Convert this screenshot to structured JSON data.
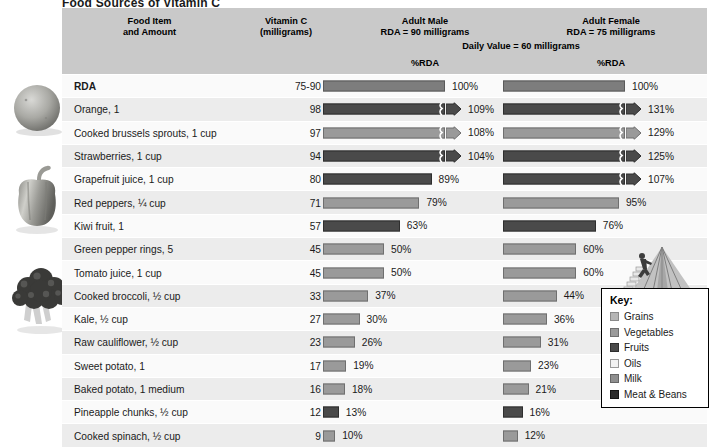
{
  "title": "Food Sources of Vitamin C",
  "header": {
    "food_item": "Food Item",
    "food_item_line2": "and Amount",
    "vitamin_c": "Vitamin C",
    "vitamin_c_line2": "(milligrams)",
    "adult_male": "Adult Male",
    "adult_male_line2": "RDA = 90 milligrams",
    "adult_female": "Adult Female",
    "adult_female_line2": "RDA = 75 milligrams",
    "daily_value": "Daily Value = 60 milligrams",
    "pct_rda_male": "%RDA",
    "pct_rda_female": "%RDA"
  },
  "chart_data": {
    "type": "bar",
    "title": "Food Sources of Vitamin C",
    "xlabel": "%RDA",
    "ylabel": "Food Item and Amount",
    "xlim": [
      0,
      100
    ],
    "grid": false,
    "legend_position": "bottom-right",
    "categories": [
      "RDA",
      "Orange, 1",
      "Cooked brussels sprouts, 1 cup",
      "Strawberries, 1 cup",
      "Grapefruit juice, 1 cup",
      "Red peppers, ¼ cup",
      "Kiwi fruit, 1",
      "Green pepper rings, 5",
      "Tomato juice, 1 cup",
      "Cooked broccoli, ½ cup",
      "Kale, ½ cup",
      "Raw cauliflower, ½ cup",
      "Sweet potato, 1",
      "Baked potato, 1 medium",
      "Pineapple chunks, ½ cup",
      "Cooked spinach, ½ cup"
    ],
    "series": [
      {
        "name": "Vitamin C (milligrams)",
        "values": [
          null,
          98,
          97,
          94,
          80,
          71,
          57,
          45,
          45,
          33,
          27,
          23,
          17,
          16,
          12,
          9
        ]
      },
      {
        "name": "Adult Male %RDA",
        "values": [
          100,
          109,
          108,
          104,
          89,
          79,
          63,
          50,
          50,
          37,
          30,
          26,
          19,
          18,
          13,
          10
        ]
      },
      {
        "name": "Adult Female %RDA",
        "values": [
          100,
          131,
          129,
          125,
          107,
          95,
          76,
          60,
          60,
          44,
          36,
          31,
          23,
          21,
          16,
          12
        ]
      }
    ]
  },
  "rows": [
    {
      "name": "RDA",
      "amount": "75-90",
      "male_pct": 100,
      "male_label": "100%",
      "female_pct": 100,
      "female_label": "100%",
      "group": "rda",
      "bold": true
    },
    {
      "name": "Orange, 1",
      "amount": "98",
      "male_pct": 109,
      "male_label": "109%",
      "female_pct": 131,
      "female_label": "131%",
      "group": "fruits",
      "bold": false
    },
    {
      "name": "Cooked brussels sprouts, 1 cup",
      "amount": "97",
      "male_pct": 108,
      "male_label": "108%",
      "female_pct": 129,
      "female_label": "129%",
      "group": "veg",
      "bold": false
    },
    {
      "name": "Strawberries, 1 cup",
      "amount": "94",
      "male_pct": 104,
      "male_label": "104%",
      "female_pct": 125,
      "female_label": "125%",
      "group": "fruits",
      "bold": false
    },
    {
      "name": "Grapefruit juice, 1 cup",
      "amount": "80",
      "male_pct": 89,
      "male_label": "89%",
      "female_pct": 107,
      "female_label": "107%",
      "group": "fruits",
      "bold": false
    },
    {
      "name": "Red peppers, ¼ cup",
      "amount": "71",
      "male_pct": 79,
      "male_label": "79%",
      "female_pct": 95,
      "female_label": "95%",
      "group": "veg",
      "bold": false
    },
    {
      "name": "Kiwi fruit, 1",
      "amount": "57",
      "male_pct": 63,
      "male_label": "63%",
      "female_pct": 76,
      "female_label": "76%",
      "group": "fruits",
      "bold": false
    },
    {
      "name": "Green pepper rings, 5",
      "amount": "45",
      "male_pct": 50,
      "male_label": "50%",
      "female_pct": 60,
      "female_label": "60%",
      "group": "veg",
      "bold": false
    },
    {
      "name": "Tomato juice, 1 cup",
      "amount": "45",
      "male_pct": 50,
      "male_label": "50%",
      "female_pct": 60,
      "female_label": "60%",
      "group": "veg",
      "bold": false
    },
    {
      "name": "Cooked broccoli, ½ cup",
      "amount": "33",
      "male_pct": 37,
      "male_label": "37%",
      "female_pct": 44,
      "female_label": "44%",
      "group": "veg",
      "bold": false
    },
    {
      "name": "Kale, ½ cup",
      "amount": "27",
      "male_pct": 30,
      "male_label": "30%",
      "female_pct": 36,
      "female_label": "36%",
      "group": "veg",
      "bold": false
    },
    {
      "name": "Raw cauliflower, ½ cup",
      "amount": "23",
      "male_pct": 26,
      "male_label": "26%",
      "female_pct": 31,
      "female_label": "31%",
      "group": "veg",
      "bold": false
    },
    {
      "name": "Sweet potato, 1",
      "amount": "17",
      "male_pct": 19,
      "male_label": "19%",
      "female_pct": 23,
      "female_label": "23%",
      "group": "veg",
      "bold": false
    },
    {
      "name": "Baked potato, 1 medium",
      "amount": "16",
      "male_pct": 18,
      "male_label": "18%",
      "female_pct": 21,
      "female_label": "21%",
      "group": "veg",
      "bold": false
    },
    {
      "name": "Pineapple chunks, ½ cup",
      "amount": "12",
      "male_pct": 13,
      "male_label": "13%",
      "female_pct": 16,
      "female_label": "16%",
      "group": "fruits",
      "bold": false
    },
    {
      "name": "Cooked spinach, ½ cup",
      "amount": "9",
      "male_pct": 10,
      "male_label": "10%",
      "female_pct": 12,
      "female_label": "12%",
      "group": "veg",
      "bold": false
    }
  ],
  "key": {
    "title": "Key:",
    "items": [
      {
        "label": "Grains",
        "swatch": "grains",
        "color": "#b6b6b6"
      },
      {
        "label": "Vegetables",
        "swatch": "veg",
        "color": "#9a9a9a"
      },
      {
        "label": "Fruits",
        "swatch": "fruits",
        "color": "#4a4a4a"
      },
      {
        "label": "Oils",
        "swatch": "oils",
        "color": "#f2f2f2"
      },
      {
        "label": "Milk",
        "swatch": "milk",
        "color": "#8f8f8f"
      },
      {
        "label": "Meat & Beans",
        "swatch": "meat",
        "color": "#2b2b2b"
      }
    ]
  },
  "photos": [
    {
      "name": "orange-photo"
    },
    {
      "name": "bell-pepper-photo"
    },
    {
      "name": "broccoli-photo"
    }
  ],
  "logo": {
    "name": "mypyramid-logo"
  }
}
